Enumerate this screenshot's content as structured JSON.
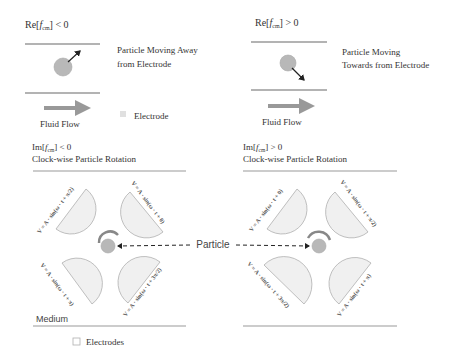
{
  "colors": {
    "channel_line": "#9a9a9a",
    "particle_fill": "#b8b8b8",
    "particle_stroke": "#a8a8a8",
    "electrode_fill": "#f0f0f0",
    "electrode_stroke": "#b0b0b0",
    "flow_arrow": "#999999",
    "arrow": "#222222",
    "rotation_arc": "#888888",
    "text": "#333333"
  },
  "panels": {
    "left_top": {
      "condition_prefix": "Re[",
      "condition_sub": "f",
      "condition_subsub": "cm",
      "condition_suffix": "] < 0",
      "description_line1": "Particle Moving Away",
      "description_line2": "from Electrode",
      "flow_label": "Fluid Flow",
      "legend_label": "Electrode"
    },
    "right_top": {
      "condition_prefix": "Re[",
      "condition_sub": "f",
      "condition_subsub": "cm",
      "condition_suffix": "] > 0",
      "description_line1": "Particle Moving",
      "description_line2": "Towards from Electrode",
      "flow_label": "Fluid Flow"
    },
    "left_bottom": {
      "condition_prefix": "Im[",
      "condition_sub": "f",
      "condition_subsub": "cm",
      "condition_suffix": "] < 0",
      "rotation_label": "Clock-wise Particle Rotation",
      "voltages": {
        "top_left": "V = A · sin(ω · t + π/2)",
        "top_right": "V = A · sin(ω · t + 0)",
        "bottom_left": "V = A · sin(ω · t + π)",
        "bottom_right": "V = A · sin(ω · t + 3π/2)"
      },
      "medium_label": "Medium",
      "legend_label": "Electrodes"
    },
    "right_bottom": {
      "condition_prefix": "Im[",
      "condition_sub": "f",
      "condition_subsub": "cm",
      "condition_suffix": "] > 0",
      "rotation_label": "Clock-wise Particle Rotation",
      "voltages": {
        "top_left": "V = A · sin(ω · t + 0)",
        "top_right": "V = A · sin(ω · t + π/2)",
        "bottom_left": "V = A · sin(ω · t + 3π/2)",
        "bottom_right": "V = A · sin(ω · t + π)"
      }
    }
  },
  "particle_label": "Particle"
}
